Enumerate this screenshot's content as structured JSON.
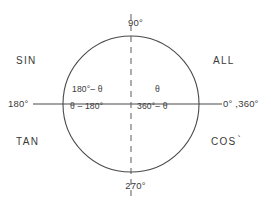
{
  "figure": {
    "kind": "unit-circle-quadrant-diagram",
    "colors": {
      "background": "#ffffff",
      "stroke": "#4a4a4a",
      "text": "#3a3a3a"
    },
    "geometry": {
      "center_x": 131,
      "center_y": 104,
      "radius": 68,
      "horizontal_axis_x1": 33,
      "horizontal_axis_x2": 222,
      "vertical_axis_y1": 14,
      "vertical_axis_y2": 196
    },
    "axis_labels": {
      "top": "90°",
      "bottom": "270°",
      "left": "180°",
      "right": "0° ,360°"
    },
    "quadrant_mnemonics": {
      "second": "SIN",
      "first": "ALL",
      "third": "TAN",
      "fourth": "COS",
      "fourth_mark": "`"
    },
    "quadrant_expressions": {
      "second": "180°– θ",
      "third": "θ – 180°",
      "first": "θ",
      "fourth": "360°– θ"
    }
  }
}
